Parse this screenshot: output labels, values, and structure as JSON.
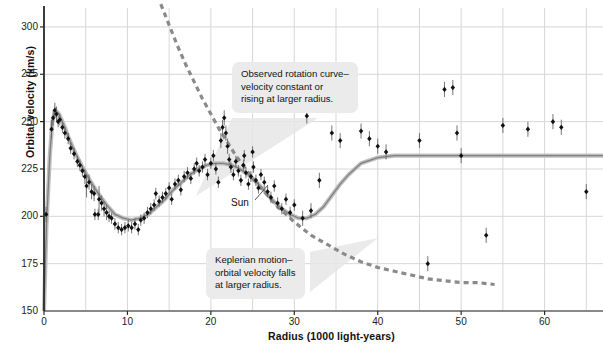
{
  "chart_data": {
    "type": "scatter",
    "title": "",
    "xlabel": "Radius (1000 light-years)",
    "ylabel": "Orbital velocity (km/s)",
    "xlim": [
      0,
      67
    ],
    "ylim": [
      150,
      310
    ],
    "xticks": [
      0,
      10,
      20,
      30,
      40,
      50,
      60
    ],
    "yticks": [
      150,
      175,
      200,
      225,
      250,
      275,
      300
    ],
    "xtick_labels": [
      "0",
      "10",
      "20",
      "30",
      "40",
      "50",
      "60"
    ],
    "ytick_labels": [
      "150",
      "175",
      "200",
      "225",
      "250",
      "275",
      "300"
    ],
    "x_minor_step": 5,
    "grid": true,
    "legend": "none",
    "series": [
      {
        "name": "Observed rotation curve (model fit)",
        "type": "line",
        "style": "solid",
        "color": "#808080",
        "x": [
          0,
          0.3,
          0.7,
          1.0,
          1.4,
          1.8,
          2.4,
          3.0,
          3.8,
          4.6,
          5.5,
          6.5,
          7.5,
          8.5,
          9.5,
          10.5,
          11.5,
          12.5,
          13.5,
          14.5,
          15.5,
          16.5,
          17.5,
          18.5,
          19.5,
          20.5,
          21.5,
          22.5,
          23.5,
          24.5,
          25.5,
          26.5,
          27.5,
          28.5,
          29.5,
          30.5,
          31.5,
          32.5,
          33.5,
          34.5,
          35.5,
          36.5,
          38,
          40,
          42,
          44,
          46,
          50,
          55,
          60,
          67
        ],
        "y": [
          150,
          196,
          232,
          250,
          256,
          254,
          248,
          241,
          233,
          226,
          219,
          212,
          206,
          201,
          199,
          198,
          199,
          201,
          205,
          209,
          214,
          218,
          222,
          225,
          227,
          228,
          228,
          227,
          225,
          222,
          218,
          213,
          208,
          204,
          201,
          199,
          199,
          201,
          205,
          211,
          217,
          222,
          228,
          231,
          232,
          232,
          232,
          232,
          232,
          232,
          232
        ]
      },
      {
        "name": "Keplerian motion prediction",
        "type": "line",
        "style": "dashed",
        "color": "#8a8a8a",
        "x": [
          14,
          15,
          16,
          17,
          18,
          19,
          20,
          21,
          22,
          23,
          24,
          25,
          26,
          27,
          28,
          29,
          30,
          32,
          34,
          36,
          38,
          40,
          42,
          44,
          46,
          48,
          50,
          52,
          54
        ],
        "y": [
          312,
          301,
          290,
          280,
          271,
          262,
          254,
          246,
          239,
          232,
          226,
          220,
          215,
          210,
          205,
          201,
          197,
          190,
          185,
          180,
          176,
          173,
          171,
          169,
          167,
          166,
          165,
          165,
          164
        ]
      },
      {
        "name": "Measured data points",
        "type": "scatter",
        "color": "#111111",
        "marker": "diamond",
        "points": [
          {
            "x": 0.25,
            "y": 201,
            "err": 4
          },
          {
            "x": 0.9,
            "y": 246,
            "err": 5
          },
          {
            "x": 1.1,
            "y": 252,
            "err": 4
          },
          {
            "x": 1.3,
            "y": 256,
            "err": 4
          },
          {
            "x": 1.5,
            "y": 254,
            "err": 4
          },
          {
            "x": 1.7,
            "y": 250,
            "err": 3
          },
          {
            "x": 1.9,
            "y": 251,
            "err": 3
          },
          {
            "x": 2.2,
            "y": 247,
            "err": 3
          },
          {
            "x": 2.5,
            "y": 244,
            "err": 3
          },
          {
            "x": 2.9,
            "y": 241,
            "err": 3
          },
          {
            "x": 3.2,
            "y": 236,
            "err": 3
          },
          {
            "x": 3.6,
            "y": 233,
            "err": 3
          },
          {
            "x": 4.0,
            "y": 229,
            "err": 3
          },
          {
            "x": 4.3,
            "y": 227,
            "err": 3
          },
          {
            "x": 4.6,
            "y": 224,
            "err": 3
          },
          {
            "x": 4.9,
            "y": 221,
            "err": 4
          },
          {
            "x": 5.1,
            "y": 216,
            "err": 6
          },
          {
            "x": 5.4,
            "y": 218,
            "err": 4
          },
          {
            "x": 5.7,
            "y": 213,
            "err": 4
          },
          {
            "x": 6.0,
            "y": 212,
            "err": 4
          },
          {
            "x": 6.1,
            "y": 201,
            "err": 3
          },
          {
            "x": 6.5,
            "y": 201,
            "err": 3
          },
          {
            "x": 6.6,
            "y": 209,
            "err": 7
          },
          {
            "x": 6.9,
            "y": 207,
            "err": 4
          },
          {
            "x": 7.2,
            "y": 204,
            "err": 4
          },
          {
            "x": 7.5,
            "y": 202,
            "err": 4
          },
          {
            "x": 7.8,
            "y": 200,
            "err": 3
          },
          {
            "x": 8.1,
            "y": 199,
            "err": 3
          },
          {
            "x": 8.5,
            "y": 196,
            "err": 3
          },
          {
            "x": 8.9,
            "y": 194,
            "err": 3
          },
          {
            "x": 9.3,
            "y": 193,
            "err": 3
          },
          {
            "x": 9.7,
            "y": 194,
            "err": 3
          },
          {
            "x": 10.1,
            "y": 195,
            "err": 3
          },
          {
            "x": 10.5,
            "y": 194,
            "err": 3
          },
          {
            "x": 10.9,
            "y": 196,
            "err": 3
          },
          {
            "x": 11.3,
            "y": 193,
            "err": 3
          },
          {
            "x": 11.6,
            "y": 198,
            "err": 3
          },
          {
            "x": 12.0,
            "y": 199,
            "err": 3
          },
          {
            "x": 12.4,
            "y": 202,
            "err": 3
          },
          {
            "x": 12.8,
            "y": 204,
            "err": 3
          },
          {
            "x": 13.2,
            "y": 206,
            "err": 3
          },
          {
            "x": 13.4,
            "y": 212,
            "err": 3
          },
          {
            "x": 13.8,
            "y": 208,
            "err": 3
          },
          {
            "x": 14.2,
            "y": 210,
            "err": 3
          },
          {
            "x": 14.6,
            "y": 212,
            "err": 3
          },
          {
            "x": 15.0,
            "y": 215,
            "err": 3
          },
          {
            "x": 15.3,
            "y": 209,
            "err": 3
          },
          {
            "x": 15.7,
            "y": 217,
            "err": 3
          },
          {
            "x": 16.1,
            "y": 219,
            "err": 3
          },
          {
            "x": 16.4,
            "y": 214,
            "err": 3
          },
          {
            "x": 16.8,
            "y": 221,
            "err": 3
          },
          {
            "x": 17.2,
            "y": 223,
            "err": 3
          },
          {
            "x": 17.6,
            "y": 220,
            "err": 3
          },
          {
            "x": 18.0,
            "y": 225,
            "err": 3
          },
          {
            "x": 18.3,
            "y": 228,
            "err": 3
          },
          {
            "x": 18.6,
            "y": 224,
            "err": 3
          },
          {
            "x": 19.0,
            "y": 226,
            "err": 3
          },
          {
            "x": 19.3,
            "y": 230,
            "err": 3
          },
          {
            "x": 19.6,
            "y": 222,
            "err": 3
          },
          {
            "x": 20.0,
            "y": 228,
            "err": 3
          },
          {
            "x": 20.3,
            "y": 232,
            "err": 3
          },
          {
            "x": 20.6,
            "y": 225,
            "err": 3
          },
          {
            "x": 20.9,
            "y": 218,
            "err": 3
          },
          {
            "x": 21.2,
            "y": 240,
            "err": 4
          },
          {
            "x": 21.4,
            "y": 247,
            "err": 4
          },
          {
            "x": 21.6,
            "y": 252,
            "err": 4
          },
          {
            "x": 21.8,
            "y": 244,
            "err": 4
          },
          {
            "x": 22.0,
            "y": 237,
            "err": 4
          },
          {
            "x": 22.2,
            "y": 230,
            "err": 3
          },
          {
            "x": 22.4,
            "y": 226,
            "err": 3
          },
          {
            "x": 22.7,
            "y": 222,
            "err": 3
          },
          {
            "x": 23.0,
            "y": 229,
            "err": 3
          },
          {
            "x": 23.3,
            "y": 224,
            "err": 3
          },
          {
            "x": 23.6,
            "y": 219,
            "err": 3
          },
          {
            "x": 23.9,
            "y": 227,
            "err": 3
          },
          {
            "x": 24.2,
            "y": 223,
            "err": 3
          },
          {
            "x": 24.5,
            "y": 217,
            "err": 3
          },
          {
            "x": 24.8,
            "y": 221,
            "err": 3
          },
          {
            "x": 25.1,
            "y": 226,
            "err": 3
          },
          {
            "x": 25.4,
            "y": 219,
            "err": 3
          },
          {
            "x": 25.7,
            "y": 215,
            "err": 3
          },
          {
            "x": 26.0,
            "y": 222,
            "err": 3
          },
          {
            "x": 26.4,
            "y": 218,
            "err": 3
          },
          {
            "x": 26.8,
            "y": 213,
            "err": 3
          },
          {
            "x": 27.2,
            "y": 210,
            "err": 3
          },
          {
            "x": 27.6,
            "y": 216,
            "err": 3
          },
          {
            "x": 28.0,
            "y": 207,
            "err": 3
          },
          {
            "x": 28.5,
            "y": 204,
            "err": 3
          },
          {
            "x": 29.0,
            "y": 209,
            "err": 3
          },
          {
            "x": 29.5,
            "y": 202,
            "err": 3
          },
          {
            "x": 30.0,
            "y": 206,
            "err": 3
          },
          {
            "x": 24.0,
            "y": 232,
            "err": 3
          },
          {
            "x": 25.0,
            "y": 234,
            "err": 3
          },
          {
            "x": 31.5,
            "y": 253,
            "err": 4
          },
          {
            "x": 36.0,
            "y": 263,
            "err": 4
          },
          {
            "x": 37.0,
            "y": 263,
            "err": 4
          },
          {
            "x": 34.5,
            "y": 244,
            "err": 4
          },
          {
            "x": 35.5,
            "y": 240,
            "err": 4
          },
          {
            "x": 38.0,
            "y": 245,
            "err": 4
          },
          {
            "x": 39.0,
            "y": 241,
            "err": 4
          },
          {
            "x": 40.0,
            "y": 237,
            "err": 4
          },
          {
            "x": 41.0,
            "y": 234,
            "err": 4
          },
          {
            "x": 45.0,
            "y": 240,
            "err": 4
          },
          {
            "x": 48.0,
            "y": 267,
            "err": 4
          },
          {
            "x": 49.0,
            "y": 268,
            "err": 4
          },
          {
            "x": 49.5,
            "y": 244,
            "err": 4
          },
          {
            "x": 50.0,
            "y": 232,
            "err": 4
          },
          {
            "x": 53.0,
            "y": 190,
            "err": 4
          },
          {
            "x": 55.0,
            "y": 248,
            "err": 4
          },
          {
            "x": 58.0,
            "y": 246,
            "err": 4
          },
          {
            "x": 61.0,
            "y": 250,
            "err": 4
          },
          {
            "x": 62.0,
            "y": 247,
            "err": 4
          },
          {
            "x": 65.0,
            "y": 213,
            "err": 4
          },
          {
            "x": 46.0,
            "y": 175,
            "err": 4
          },
          {
            "x": 33.0,
            "y": 219,
            "err": 4
          },
          {
            "x": 31.0,
            "y": 199,
            "err": 4
          },
          {
            "x": 32.0,
            "y": 203,
            "err": 4
          }
        ]
      }
    ],
    "annotations": [
      {
        "name": "observed-rotation-callout",
        "lines": [
          "Observed rotation curve–",
          "velocity constant or",
          "rising at larger radius."
        ]
      },
      {
        "name": "keplerian-callout",
        "lines": [
          "Keplerian motion–",
          "orbital velocity falls",
          "at larger radius."
        ]
      },
      {
        "name": "sun-marker-label",
        "lines": [
          "Sun"
        ]
      }
    ],
    "colors": {
      "data_point": "#111111",
      "solid_curve": "#808080",
      "dashed_curve": "#8a8a8a",
      "grid": "#d7d7d7",
      "axis": "#2b2b2b",
      "callout_bg": "#ebebeb"
    }
  }
}
